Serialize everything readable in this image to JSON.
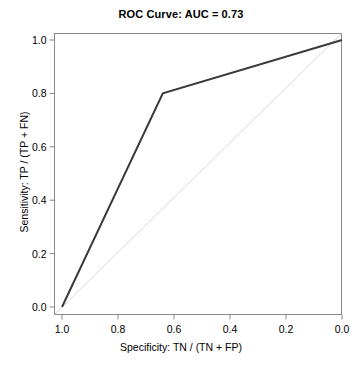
{
  "chart_data": {
    "type": "line",
    "title": "ROC Curve: AUC = 0.73",
    "xlabel": "Specificity: TN / (TN + FP)",
    "ylabel": "Sensitivity: TP / (TP + FN)",
    "xlim": [
      1.0,
      0.0
    ],
    "ylim": [
      0.0,
      1.0
    ],
    "x_axis_reversed": true,
    "grid": false,
    "legend": null,
    "auc": 0.73,
    "xticks": [
      "1.0",
      "0.8",
      "0.6",
      "0.4",
      "0.2",
      "0.0"
    ],
    "xtick_values": [
      1.0,
      0.8,
      0.6,
      0.4,
      0.2,
      0.0
    ],
    "yticks": [
      "0.0",
      "0.2",
      "0.4",
      "0.6",
      "0.8",
      "1.0"
    ],
    "ytick_values": [
      0.0,
      0.2,
      0.4,
      0.6,
      0.8,
      1.0
    ],
    "series": [
      {
        "name": "ROC curve",
        "color": "#3a3a3a",
        "width": 2,
        "x": [
          1.0,
          0.64,
          0.0
        ],
        "y": [
          0.0,
          0.8,
          1.0
        ]
      },
      {
        "name": "Chance diagonal",
        "color": "#d9d9d9",
        "width": 1,
        "x": [
          1.0,
          0.0
        ],
        "y": [
          0.0,
          1.0
        ]
      }
    ]
  },
  "axes": {
    "box_color": "#888888",
    "tick_color": "#888888"
  }
}
